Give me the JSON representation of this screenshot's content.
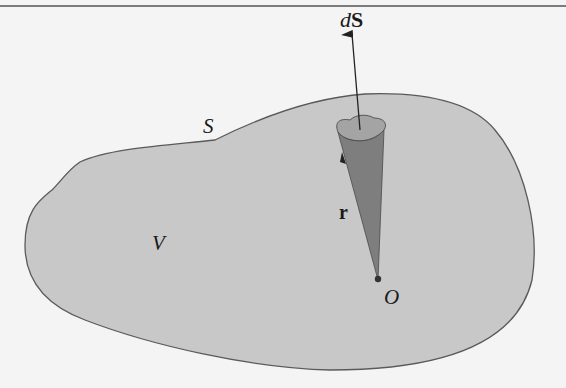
{
  "figure": {
    "labels": {
      "dS_d": "d",
      "dS_S": "S",
      "surface": "S",
      "volume": "V",
      "position_vector": "r",
      "origin": "O"
    },
    "colors": {
      "background": "#f4f4f4",
      "region_fill": "#c8c8c8",
      "outline": "#5a5a5a",
      "cone_fill": "#7e7e7e",
      "patch_fill": "#a4a4a4",
      "rule": "#555555"
    }
  }
}
